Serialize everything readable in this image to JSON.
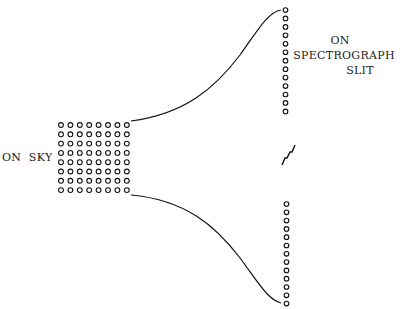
{
  "diagram": {
    "labels": {
      "sky": "ON  SKY",
      "slit_line1": "ON",
      "slit_line2": "SPECTROGRAPH",
      "slit_line3": "SLIT"
    },
    "sky_grid": {
      "columns": 8,
      "rows": 8,
      "x0": 61,
      "y0": 125,
      "dx": 9.4,
      "dy": 9.3,
      "r": 2.4
    },
    "slit_upper": {
      "count": 13,
      "x": 285.5,
      "y0": 10,
      "dy": 8.45,
      "r": 2.3
    },
    "slit_lower": {
      "count": 13,
      "x": 286.5,
      "y0": 204,
      "dy": 8.3,
      "r": 2.3
    },
    "curves": {
      "upper": "M131,121 C185,114 215,88 240,55 C258,30 268,12 281,10",
      "lower": "M131,195 C185,200 215,225 240,258 C258,282 268,300 281,303"
    },
    "break_mark": "M282,165 L285,158 L287,158 L290,152 L292,152 L295,145",
    "colors": {
      "ink": "#111111",
      "background": "#ffffff"
    }
  }
}
